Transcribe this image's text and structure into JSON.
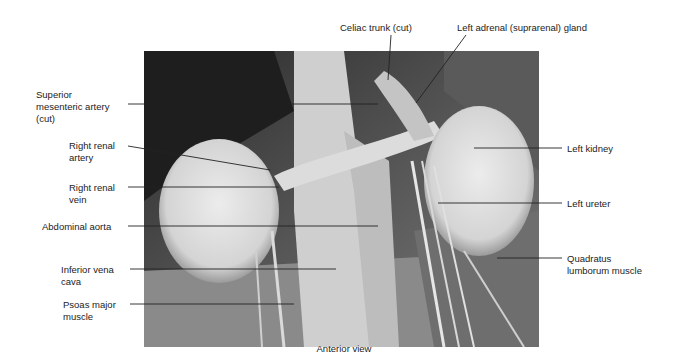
{
  "figure": {
    "view_caption": "Anterior view",
    "labels": {
      "celiac_trunk": "Celiac trunk (cut)",
      "left_adrenal": "Left adrenal (suprarenal) gland",
      "superior_mesenteric": "Superior\nmesenteric artery\n(cut)",
      "right_renal_artery": "Right renal\nartery",
      "right_renal_vein": "Right renal\nvein",
      "abdominal_aorta": "Abdominal aorta",
      "inferior_vena_cava": "Inferior vena\ncava",
      "psoas_major": "Psoas major\nmuscle",
      "left_kidney": "Left kidney",
      "left_ureter": "Left ureter",
      "quadratus_lumborum": "Quadratus\nlumborum muscle"
    }
  }
}
